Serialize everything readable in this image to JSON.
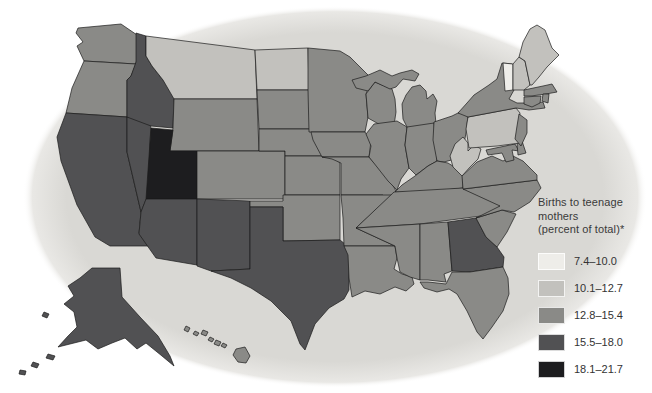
{
  "figure": {
    "type": "choropleth-map",
    "region": "United States",
    "oval_color": "#d9d8d4",
    "border_color": "#1b1b1b",
    "background_color": "#ffffff"
  },
  "legend": {
    "title": "Births to teenage mothers (percent of total)*",
    "title_lines": [
      "Births to teenage",
      "mothers",
      "(percent of total)*"
    ],
    "categories": [
      {
        "range": "7.4–10.0",
        "color": "#eeede9"
      },
      {
        "range": "10.1–12.7",
        "color": "#c2c1bd"
      },
      {
        "range": "12.8–15.4",
        "color": "#8a8a87"
      },
      {
        "range": "15.5–18.0",
        "color": "#515153"
      },
      {
        "range": "18.1–21.7",
        "color": "#1d1d1f"
      }
    ]
  },
  "map_data": {
    "type": "choropleth",
    "measure": "Births to teenage mothers (percent of total)",
    "states": [
      {
        "abbr": "WA",
        "name": "Washington",
        "category": 2
      },
      {
        "abbr": "OR",
        "name": "Oregon",
        "category": 2
      },
      {
        "abbr": "CA",
        "name": "California",
        "category": 3
      },
      {
        "abbr": "NV",
        "name": "Nevada",
        "category": 3
      },
      {
        "abbr": "ID",
        "name": "Idaho",
        "category": 3
      },
      {
        "abbr": "MT",
        "name": "Montana",
        "category": 1
      },
      {
        "abbr": "WY",
        "name": "Wyoming",
        "category": 2
      },
      {
        "abbr": "UT",
        "name": "Utah",
        "category": 4
      },
      {
        "abbr": "CO",
        "name": "Colorado",
        "category": 2
      },
      {
        "abbr": "AZ",
        "name": "Arizona",
        "category": 3
      },
      {
        "abbr": "NM",
        "name": "New Mexico",
        "category": 3
      },
      {
        "abbr": "ND",
        "name": "North Dakota",
        "category": 1
      },
      {
        "abbr": "SD",
        "name": "South Dakota",
        "category": 2
      },
      {
        "abbr": "NE",
        "name": "Nebraska",
        "category": 2
      },
      {
        "abbr": "KS",
        "name": "Kansas",
        "category": 2
      },
      {
        "abbr": "OK",
        "name": "Oklahoma",
        "category": 2
      },
      {
        "abbr": "TX",
        "name": "Texas",
        "category": 3
      },
      {
        "abbr": "MN",
        "name": "Minnesota",
        "category": 2
      },
      {
        "abbr": "IA",
        "name": "Iowa",
        "category": 2
      },
      {
        "abbr": "MO",
        "name": "Missouri",
        "category": 2
      },
      {
        "abbr": "AR",
        "name": "Arkansas",
        "category": 2
      },
      {
        "abbr": "LA",
        "name": "Louisiana",
        "category": 2
      },
      {
        "abbr": "WI",
        "name": "Wisconsin",
        "category": 2
      },
      {
        "abbr": "IL",
        "name": "Illinois",
        "category": 2
      },
      {
        "abbr": "MI",
        "name": "Michigan",
        "category": 2
      },
      {
        "abbr": "IN",
        "name": "Indiana",
        "category": 2
      },
      {
        "abbr": "OH",
        "name": "Ohio",
        "category": 2
      },
      {
        "abbr": "KY",
        "name": "Kentucky",
        "category": 2
      },
      {
        "abbr": "TN",
        "name": "Tennessee",
        "category": 2
      },
      {
        "abbr": "MS",
        "name": "Mississippi",
        "category": 2
      },
      {
        "abbr": "AL",
        "name": "Alabama",
        "category": 2
      },
      {
        "abbr": "GA",
        "name": "Georgia",
        "category": 3
      },
      {
        "abbr": "FL",
        "name": "Florida",
        "category": 2
      },
      {
        "abbr": "SC",
        "name": "South Carolina",
        "category": 2
      },
      {
        "abbr": "NC",
        "name": "North Carolina",
        "category": 2
      },
      {
        "abbr": "VA",
        "name": "Virginia",
        "category": 2
      },
      {
        "abbr": "WV",
        "name": "West Virginia",
        "category": 1
      },
      {
        "abbr": "MD",
        "name": "Maryland",
        "category": 2
      },
      {
        "abbr": "DE",
        "name": "Delaware",
        "category": 2
      },
      {
        "abbr": "PA",
        "name": "Pennsylvania",
        "category": 1
      },
      {
        "abbr": "NJ",
        "name": "New Jersey",
        "category": 2
      },
      {
        "abbr": "NY",
        "name": "New York",
        "category": 2
      },
      {
        "abbr": "VT",
        "name": "Vermont",
        "category": 0
      },
      {
        "abbr": "NH",
        "name": "New Hampshire",
        "category": 1
      },
      {
        "abbr": "ME",
        "name": "Maine",
        "category": 1
      },
      {
        "abbr": "MA",
        "name": "Massachusetts",
        "category": 2
      },
      {
        "abbr": "RI",
        "name": "Rhode Island",
        "category": 2
      },
      {
        "abbr": "CT",
        "name": "Connecticut",
        "category": 2
      },
      {
        "abbr": "AK",
        "name": "Alaska",
        "category": 3
      },
      {
        "abbr": "HI",
        "name": "Hawaii",
        "category": 2
      }
    ]
  }
}
